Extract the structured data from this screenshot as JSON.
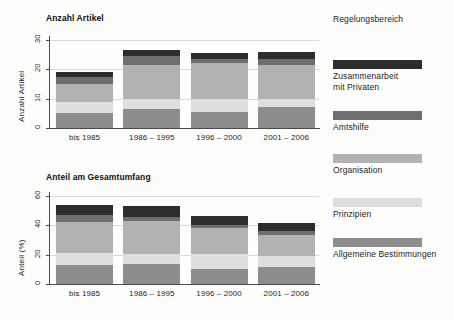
{
  "legend": {
    "title": "Regelungsbereich",
    "entries": [
      {
        "label": "Zusammenarbeit\nmit Privaten",
        "color": "#2d2d2d",
        "top": 46
      },
      {
        "label": "Amtshilfe",
        "color": "#6e6e6e",
        "top": 97
      },
      {
        "label": "Organisation",
        "color": "#b2b2b2",
        "top": 140
      },
      {
        "label": "Prinzipien",
        "color": "#dedede",
        "top": 184
      },
      {
        "label": "Allgemeine Bestimmungen",
        "color": "#8d8d8d",
        "top": 224
      }
    ]
  },
  "chart_data": [
    {
      "type": "bar",
      "stacked": true,
      "title": "Anzahl Artikel",
      "xlabel": "",
      "ylabel": "Anzahl Artikel",
      "ylim": [
        0,
        30
      ],
      "yticks": [
        0,
        10,
        20,
        30
      ],
      "ytick_labels": [
        "0",
        "10",
        "20",
        "30"
      ],
      "grid": true,
      "legend_position": "right",
      "categories": [
        "bis 1985",
        "1986 – 1995",
        "1996 – 2000",
        "2001 – 2006"
      ],
      "series": [
        {
          "name": "Allgemeine Bestimmungen",
          "color": "#8d8d8d",
          "values": [
            5.0,
            6.5,
            5.5,
            7.0
          ]
        },
        {
          "name": "Prinzipien",
          "color": "#dedede",
          "values": [
            4.0,
            3.5,
            4.5,
            3.0
          ]
        },
        {
          "name": "Organisation",
          "color": "#b2b2b2",
          "values": [
            6.0,
            11.5,
            12.0,
            11.5
          ]
        },
        {
          "name": "Amtshilfe",
          "color": "#6e6e6e",
          "values": [
            2.5,
            3.0,
            1.5,
            2.0
          ]
        },
        {
          "name": "Zusammenarbeit mit Privaten",
          "color": "#2d2d2d",
          "values": [
            1.5,
            2.0,
            2.0,
            2.5
          ]
        }
      ],
      "totals": [
        19.0,
        26.5,
        25.5,
        26.0
      ]
    },
    {
      "type": "bar",
      "stacked": true,
      "title": "Anteil am Gesamtumfang",
      "xlabel": "",
      "ylabel": "Anteil (%)",
      "ylim": [
        0,
        60
      ],
      "yticks": [
        0,
        20,
        40,
        60
      ],
      "ytick_labels": [
        "0",
        "20",
        "40",
        "60"
      ],
      "grid": true,
      "legend_position": "right",
      "categories": [
        "bis 1985",
        "1986 – 1995",
        "1996 – 2000",
        "2001 – 2006"
      ],
      "series": [
        {
          "name": "Allgemeine Bestimmungen",
          "color": "#8d8d8d",
          "values": [
            13.0,
            13.5,
            10.5,
            11.5
          ]
        },
        {
          "name": "Prinzipien",
          "color": "#dedede",
          "values": [
            8.0,
            7.0,
            10.0,
            7.5
          ]
        },
        {
          "name": "Organisation",
          "color": "#b2b2b2",
          "values": [
            21.0,
            22.5,
            17.5,
            14.5
          ]
        },
        {
          "name": "Amtshilfe",
          "color": "#6e6e6e",
          "values": [
            5.0,
            3.0,
            2.5,
            2.5
          ]
        },
        {
          "name": "Zusammenarbeit mit Privaten",
          "color": "#2d2d2d",
          "values": [
            7.0,
            7.5,
            6.0,
            5.5
          ]
        }
      ],
      "totals": [
        54.0,
        53.5,
        46.5,
        41.5
      ]
    }
  ]
}
